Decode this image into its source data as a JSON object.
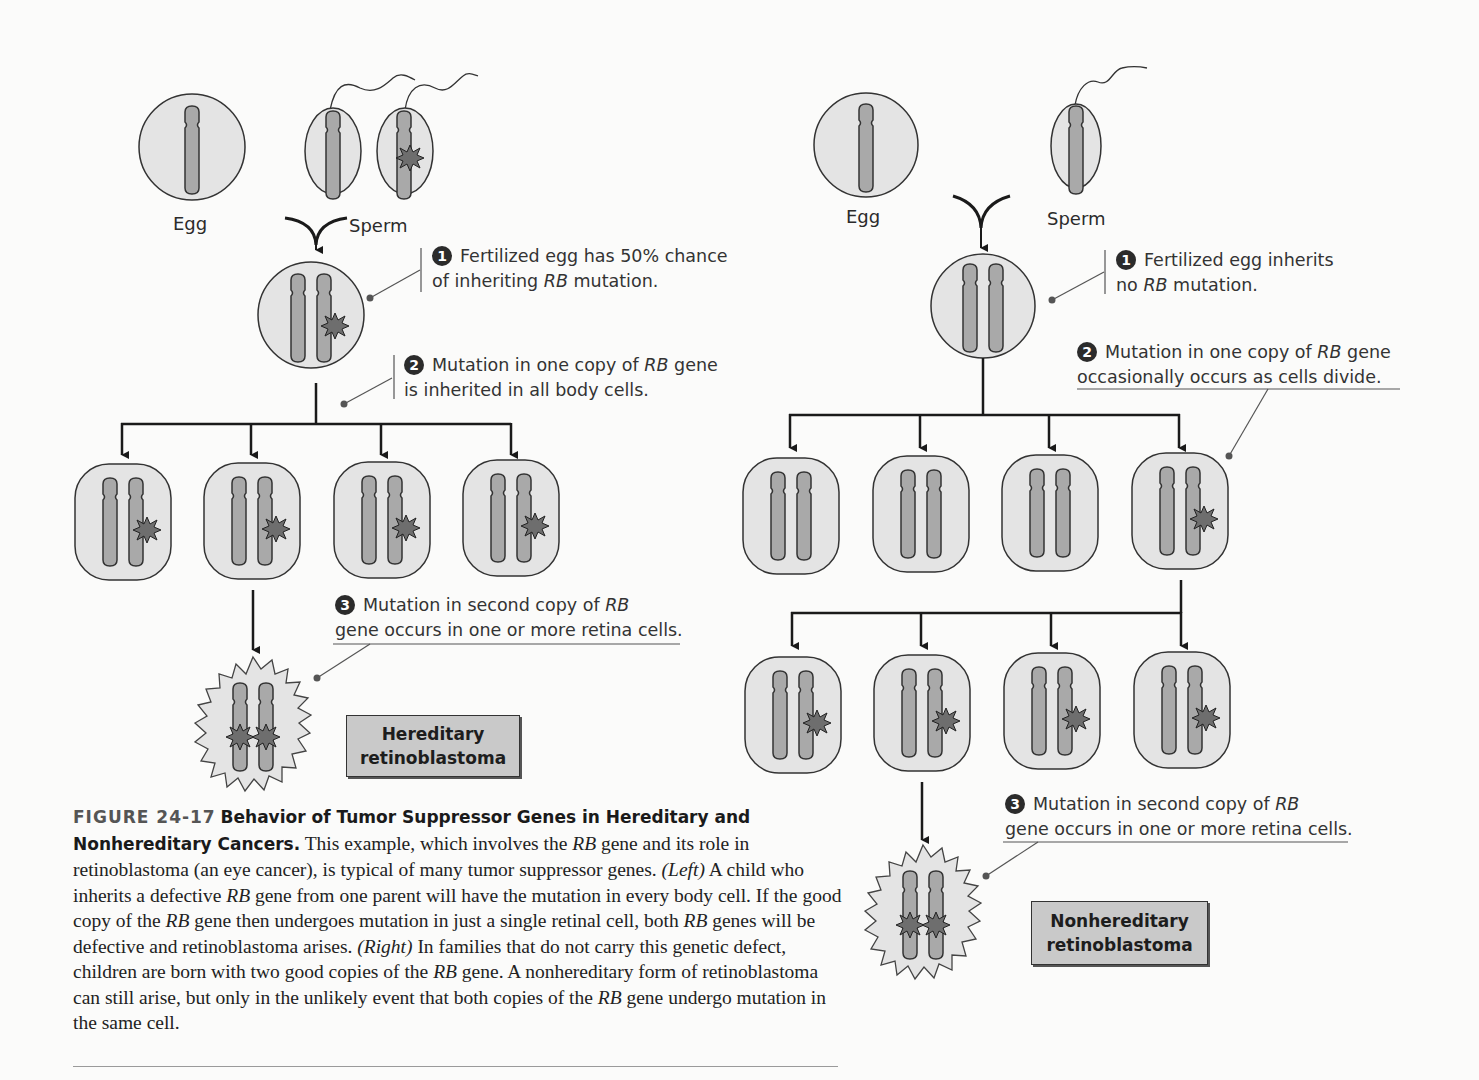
{
  "figure": {
    "number_label": "FIGURE 24-17",
    "title": "Behavior of Tumor Suppressor Genes in Hereditary and Nonhereditary Cancers.",
    "caption_parts": {
      "p1": " This example, which involves the ",
      "rb1": "RB",
      "p2": " gene and its role in retinoblastoma (an eye cancer), is typical of many tumor suppressor genes. ",
      "left": "(Left)",
      "p3": " A child who inherits a defective ",
      "rb2": "RB",
      "p4": " gene from one parent will have the mutation in every body cell. If the good copy of the ",
      "rb3": "RB",
      "p5": " gene then undergoes mutation in just a single retinal cell, both ",
      "rb4": "RB",
      "p6": " genes will be defective and retinoblastoma arises. ",
      "right": "(Right)",
      "p7": " In families that do not carry this genetic defect, children are born with two good copies of the ",
      "rb5": "RB",
      "p8": " gene. A nonhereditary form of retinoblastoma can still arise, but only in the unlikely event that both copies of the ",
      "rb6": "RB",
      "p9": " gene undergo mutation in the same cell."
    }
  },
  "colors": {
    "cell_fill": "#e4e4e4",
    "chromosome_fill": "#a9a9a9",
    "mutation_fill": "#6e6e6e",
    "outline": "#333333",
    "outcome_box": "#c9c9c9"
  },
  "left_panel": {
    "egg_label": "Egg",
    "sperm_label": "Sperm",
    "step1": {
      "num": "1",
      "line1": "Fertilized egg has 50% chance",
      "line2a": "of inheriting ",
      "line2_rb": "RB",
      "line2b": " mutation."
    },
    "step2": {
      "num": "2",
      "line1a": "Mutation in one copy of ",
      "line1_rb": "RB",
      "line1b": " gene",
      "line2": "is inherited in all body cells."
    },
    "step3": {
      "num": "3",
      "line1a": "Mutation in second copy of ",
      "line1_rb": "RB",
      "line2": "gene occurs in one or more retina cells."
    },
    "outcome": {
      "line1": "Hereditary",
      "line2": "retinoblastoma"
    }
  },
  "right_panel": {
    "egg_label": "Egg",
    "sperm_label": "Sperm",
    "step1": {
      "num": "1",
      "line1": "Fertilized egg inherits",
      "line2a": "no ",
      "line2_rb": "RB",
      "line2b": " mutation."
    },
    "step2": {
      "num": "2",
      "line1a": "Mutation in one copy of ",
      "line1_rb": "RB",
      "line1b": " gene",
      "line2": "occasionally occurs as cells divide."
    },
    "step3": {
      "num": "3",
      "line1a": "Mutation in second copy of ",
      "line1_rb": "RB",
      "line2": "gene occurs in one or more retina cells."
    },
    "outcome": {
      "line1": "Nonhereditary",
      "line2": "retinoblastoma"
    }
  }
}
